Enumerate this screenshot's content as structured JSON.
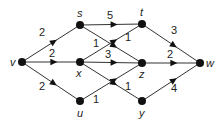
{
  "diagram": {
    "type": "directed-weighted-graph",
    "nodes": [
      {
        "id": "v",
        "label": "v",
        "x": 22,
        "y": 62,
        "lx": 10,
        "ly": 66
      },
      {
        "id": "s",
        "label": "s",
        "x": 80,
        "y": 25,
        "lx": 77,
        "ly": 17
      },
      {
        "id": "x",
        "label": "x",
        "x": 80,
        "y": 62,
        "lx": 76,
        "ly": 77
      },
      {
        "id": "u",
        "label": "u",
        "x": 80,
        "y": 101,
        "lx": 77,
        "ly": 117
      },
      {
        "id": "t",
        "label": "t",
        "x": 142,
        "y": 24,
        "lx": 140,
        "ly": 16
      },
      {
        "id": "z",
        "label": "z",
        "x": 142,
        "y": 63,
        "lx": 139,
        "ly": 78
      },
      {
        "id": "y",
        "label": "y",
        "x": 142,
        "y": 101,
        "lx": 139,
        "ly": 117
      },
      {
        "id": "w",
        "label": "w",
        "x": 200,
        "y": 63,
        "lx": 206,
        "ly": 67
      }
    ],
    "edges": [
      {
        "from": "v",
        "to": "s",
        "weight": "2",
        "wx": 42,
        "wy": 36
      },
      {
        "from": "v",
        "to": "x",
        "weight": "2",
        "wx": 52,
        "wy": 57
      },
      {
        "from": "v",
        "to": "u",
        "weight": "2",
        "wx": 42,
        "wy": 90
      },
      {
        "from": "s",
        "to": "t",
        "weight": "5",
        "wx": 110,
        "wy": 19
      },
      {
        "from": "s",
        "to": "z",
        "weight": "1",
        "wx": 96,
        "wy": 47
      },
      {
        "from": "x",
        "to": "t",
        "weight": "1",
        "wx": 128,
        "wy": 41
      },
      {
        "from": "x",
        "to": "z",
        "weight": "3",
        "wx": 108,
        "wy": 58
      },
      {
        "from": "x",
        "to": "y",
        "weight": "1",
        "wx": 128,
        "wy": 90
      },
      {
        "from": "u",
        "to": "z",
        "weight": "1",
        "wx": 96,
        "wy": 103
      },
      {
        "from": "t",
        "to": "w",
        "weight": "3",
        "wx": 174,
        "wy": 34
      },
      {
        "from": "z",
        "to": "w",
        "weight": "2",
        "wx": 170,
        "wy": 58
      },
      {
        "from": "y",
        "to": "w",
        "weight": "4",
        "wx": 174,
        "wy": 92
      }
    ]
  }
}
